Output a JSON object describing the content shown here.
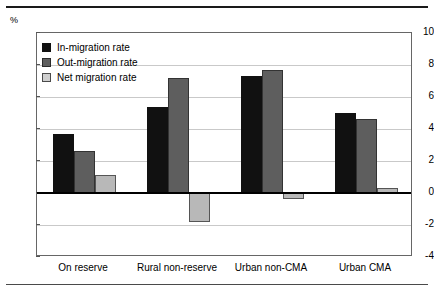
{
  "chart_data": {
    "type": "bar",
    "title": "",
    "subtitle": "",
    "xlabel": "",
    "ylabel": "%",
    "unit_label": "%",
    "ylim": [
      -4,
      10
    ],
    "ytick_step": 2,
    "yticks": [
      10,
      8,
      6,
      4,
      2,
      0,
      -2,
      -4
    ],
    "ytick_labels": [
      "10",
      "8",
      "6",
      "4",
      "2",
      "0",
      "-2",
      "-4"
    ],
    "grid": true,
    "grid_axis": "y",
    "legend_position": "top-left-inside",
    "categories": [
      "On reserve",
      "Rural non-reserve",
      "Urban non-CMA",
      "Urban CMA"
    ],
    "series": [
      {
        "name": "In-migration rate",
        "color": "#111111",
        "values": [
          3.7,
          5.4,
          7.3,
          5.0
        ]
      },
      {
        "name": "Out-migration rate",
        "color": "#5e5e5e",
        "values": [
          2.6,
          7.2,
          7.7,
          4.6
        ]
      },
      {
        "name": "Net migration rate",
        "color": "#b8b8b8",
        "values": [
          1.1,
          -1.8,
          -0.4,
          0.3
        ]
      }
    ]
  }
}
